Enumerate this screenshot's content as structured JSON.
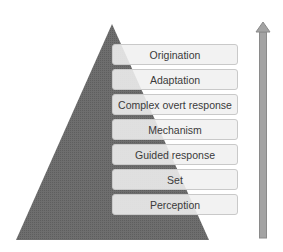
{
  "diagram": {
    "title": "",
    "levels": [
      {
        "label": "Origination"
      },
      {
        "label": "Adaptation"
      },
      {
        "label": "Complex overt response"
      },
      {
        "label": "Mechanism"
      },
      {
        "label": "Guided response"
      },
      {
        "label": "Set"
      },
      {
        "label": "Perception"
      }
    ],
    "colors": {
      "pyramid": "#6b6b6b",
      "pyramid_stripe": "#555555",
      "box_fill": "#f0f0f0",
      "box_border": "#c9c9c9",
      "arrow": "#a3a3a3",
      "arrow_border": "#8a8a8a",
      "text": "#3a3a3a"
    },
    "arrow_direction": "up"
  }
}
